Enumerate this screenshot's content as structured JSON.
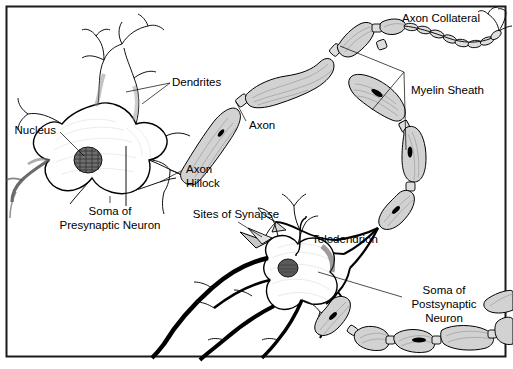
{
  "figure": {
    "background_color": "#ffffff",
    "border_color": "#1a1a1a",
    "ink_color": "#000000",
    "myelin_fill": "#d2d2d2"
  },
  "labels": {
    "dendrites": "Dendrites",
    "nucleus": "Nucleus",
    "axon": "Axon",
    "axon_hillock_line1": "Axon",
    "axon_hillock_line2": "Hillock",
    "soma_pre_line1": "Soma of",
    "soma_pre_line2": "Presynaptic Neuron",
    "sites_of_synapse": "Sites of Synapse",
    "axon_collateral": "Axon Collateral",
    "myelin_sheath": "Myelin Sheath",
    "telodendrion": "Telodendrion",
    "soma_post_line1": "Soma of",
    "soma_post_line2": "Postsynaptic",
    "soma_post_line3": "Neuron"
  }
}
